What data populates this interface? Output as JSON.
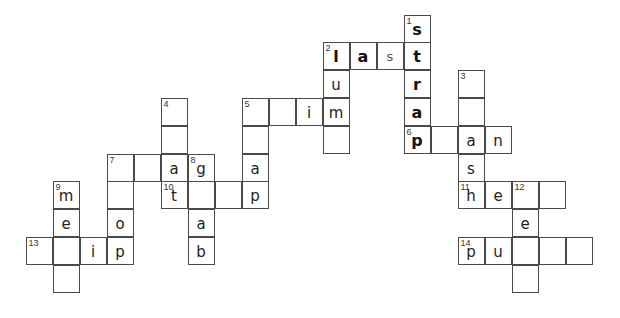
{
  "puzzle": {
    "type": "crossword",
    "grid_origin": {
      "x": 26,
      "y": 15
    },
    "cell_size": {
      "w": 27,
      "h": 27.8
    },
    "cells": [
      {
        "c": 14,
        "r": 0,
        "num": "1",
        "letter": "s",
        "style": "bold"
      },
      {
        "c": 11,
        "r": 1,
        "num": "2",
        "letter": "l",
        "style": "bold"
      },
      {
        "c": 12,
        "r": 1,
        "num": "",
        "letter": "a",
        "style": "bold"
      },
      {
        "c": 13,
        "r": 1,
        "num": "",
        "letter": "s",
        "style": "light"
      },
      {
        "c": 14,
        "r": 1,
        "num": "",
        "letter": "t",
        "style": "bold"
      },
      {
        "c": 11,
        "r": 2,
        "num": "",
        "letter": "u",
        "style": "regular"
      },
      {
        "c": 14,
        "r": 2,
        "num": "",
        "letter": "r",
        "style": "bold"
      },
      {
        "c": 16,
        "r": 2,
        "num": "3",
        "letter": "",
        "style": "regular"
      },
      {
        "c": 5,
        "r": 3,
        "num": "4",
        "letter": "",
        "style": "regular"
      },
      {
        "c": 8,
        "r": 3,
        "num": "5",
        "letter": "",
        "style": "regular"
      },
      {
        "c": 9,
        "r": 3,
        "num": "",
        "letter": "",
        "style": "regular"
      },
      {
        "c": 10,
        "r": 3,
        "num": "",
        "letter": "i",
        "style": "regular"
      },
      {
        "c": 11,
        "r": 3,
        "num": "",
        "letter": "m",
        "style": "regular"
      },
      {
        "c": 14,
        "r": 3,
        "num": "",
        "letter": "a",
        "style": "bold"
      },
      {
        "c": 16,
        "r": 3,
        "num": "",
        "letter": "",
        "style": "regular"
      },
      {
        "c": 5,
        "r": 4,
        "num": "",
        "letter": "",
        "style": "regular"
      },
      {
        "c": 8,
        "r": 4,
        "num": "",
        "letter": "",
        "style": "regular"
      },
      {
        "c": 11,
        "r": 4,
        "num": "",
        "letter": "",
        "style": "regular"
      },
      {
        "c": 14,
        "r": 4,
        "num": "6",
        "letter": "p",
        "style": "bold"
      },
      {
        "c": 15,
        "r": 4,
        "num": "",
        "letter": "",
        "style": "regular"
      },
      {
        "c": 16,
        "r": 4,
        "num": "",
        "letter": "a",
        "style": "regular"
      },
      {
        "c": 17,
        "r": 4,
        "num": "",
        "letter": "n",
        "style": "regular"
      },
      {
        "c": 3,
        "r": 5,
        "num": "7",
        "letter": "",
        "style": "regular"
      },
      {
        "c": 4,
        "r": 5,
        "num": "",
        "letter": "",
        "style": "regular"
      },
      {
        "c": 5,
        "r": 5,
        "num": "",
        "letter": "a",
        "style": "regular"
      },
      {
        "c": 6,
        "r": 5,
        "num": "8",
        "letter": "g",
        "style": "regular"
      },
      {
        "c": 8,
        "r": 5,
        "num": "",
        "letter": "a",
        "style": "regular"
      },
      {
        "c": 16,
        "r": 5,
        "num": "",
        "letter": "s",
        "style": "regular"
      },
      {
        "c": 1,
        "r": 6,
        "num": "9",
        "letter": "m",
        "style": "regular"
      },
      {
        "c": 3,
        "r": 6,
        "num": "",
        "letter": "",
        "style": "regular"
      },
      {
        "c": 5,
        "r": 6,
        "num": "10",
        "letter": "t",
        "style": "regular"
      },
      {
        "c": 6,
        "r": 6,
        "num": "",
        "letter": "",
        "style": "regular"
      },
      {
        "c": 7,
        "r": 6,
        "num": "",
        "letter": "",
        "style": "regular"
      },
      {
        "c": 8,
        "r": 6,
        "num": "",
        "letter": "p",
        "style": "regular"
      },
      {
        "c": 16,
        "r": 6,
        "num": "11",
        "letter": "h",
        "style": "regular"
      },
      {
        "c": 17,
        "r": 6,
        "num": "",
        "letter": "e",
        "style": "regular"
      },
      {
        "c": 18,
        "r": 6,
        "num": "12",
        "letter": "",
        "style": "regular"
      },
      {
        "c": 19,
        "r": 6,
        "num": "",
        "letter": "",
        "style": "regular"
      },
      {
        "c": 1,
        "r": 7,
        "num": "",
        "letter": "e",
        "style": "regular"
      },
      {
        "c": 3,
        "r": 7,
        "num": "",
        "letter": "o",
        "style": "regular"
      },
      {
        "c": 6,
        "r": 7,
        "num": "",
        "letter": "a",
        "style": "regular"
      },
      {
        "c": 18,
        "r": 7,
        "num": "",
        "letter": "e",
        "style": "regular"
      },
      {
        "c": 0,
        "r": 8,
        "num": "13",
        "letter": "",
        "style": "regular"
      },
      {
        "c": 1,
        "r": 8,
        "num": "",
        "letter": "",
        "style": "regular"
      },
      {
        "c": 2,
        "r": 8,
        "num": "",
        "letter": "i",
        "style": "regular"
      },
      {
        "c": 3,
        "r": 8,
        "num": "",
        "letter": "p",
        "style": "regular"
      },
      {
        "c": 6,
        "r": 8,
        "num": "",
        "letter": "b",
        "style": "regular"
      },
      {
        "c": 16,
        "r": 8,
        "num": "14",
        "letter": "p",
        "style": "regular"
      },
      {
        "c": 17,
        "r": 8,
        "num": "",
        "letter": "u",
        "style": "regular"
      },
      {
        "c": 18,
        "r": 8,
        "num": "",
        "letter": "",
        "style": "regular"
      },
      {
        "c": 19,
        "r": 8,
        "num": "",
        "letter": "",
        "style": "regular"
      },
      {
        "c": 20,
        "r": 8,
        "num": "",
        "letter": "",
        "style": "regular"
      },
      {
        "c": 1,
        "r": 9,
        "num": "",
        "letter": "",
        "style": "regular"
      },
      {
        "c": 18,
        "r": 9,
        "num": "",
        "letter": "",
        "style": "regular"
      }
    ]
  }
}
